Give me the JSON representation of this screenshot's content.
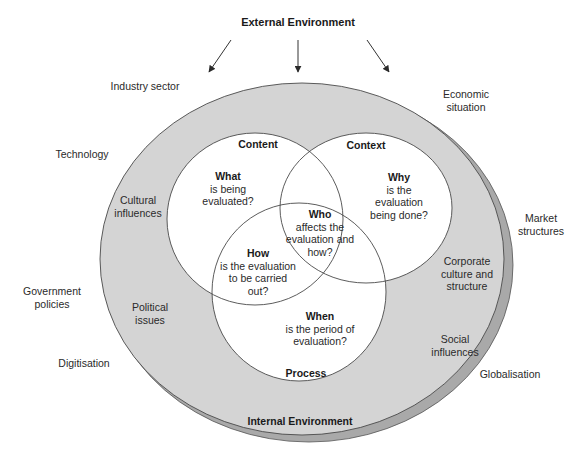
{
  "title": "External Environment",
  "internal_label": "Internal Environment",
  "external_factors": [
    {
      "id": "industry",
      "lines": [
        "Industry sector"
      ],
      "x": 145,
      "y": 90
    },
    {
      "id": "economic",
      "lines": [
        "Economic",
        "situation"
      ],
      "x": 466,
      "y": 98
    },
    {
      "id": "technology",
      "lines": [
        "Technology"
      ],
      "x": 82,
      "y": 158
    },
    {
      "id": "market",
      "lines": [
        "Market",
        "structures"
      ],
      "x": 541,
      "y": 222
    },
    {
      "id": "government",
      "lines": [
        "Government",
        "policies"
      ],
      "x": 52,
      "y": 295
    },
    {
      "id": "digitisation",
      "lines": [
        "Digitisation"
      ],
      "x": 84,
      "y": 367
    },
    {
      "id": "globalisation",
      "lines": [
        "Globalisation"
      ],
      "x": 510,
      "y": 378
    }
  ],
  "internal_factors": [
    {
      "id": "cultural",
      "lines": [
        "Cultural",
        "influences"
      ],
      "x": 138,
      "y": 204
    },
    {
      "id": "corporate",
      "lines": [
        "Corporate",
        "culture and",
        "structure"
      ],
      "x": 467,
      "y": 265
    },
    {
      "id": "political",
      "lines": [
        "Political",
        "issues"
      ],
      "x": 150,
      "y": 311
    },
    {
      "id": "social",
      "lines": [
        "Social",
        "influences"
      ],
      "x": 455,
      "y": 343
    }
  ],
  "circles": [
    {
      "id": "content",
      "label": "Content",
      "label_x": 258,
      "label_y": 148
    },
    {
      "id": "context",
      "label": "Context",
      "label_x": 366,
      "label_y": 149
    },
    {
      "id": "process",
      "label": "Process",
      "label_x": 306,
      "label_y": 377
    }
  ],
  "questions": [
    {
      "id": "what",
      "head": "What",
      "lines": [
        "is being",
        "evaluated?"
      ],
      "x": 228,
      "y": 180
    },
    {
      "id": "why",
      "head": "Why",
      "lines": [
        "is the",
        "evaluation",
        "being done?"
      ],
      "x": 399,
      "y": 181
    },
    {
      "id": "who",
      "head": "Who",
      "lines": [
        "affects the",
        "evaluation and",
        "how?"
      ],
      "x": 320,
      "y": 218
    },
    {
      "id": "how",
      "head": "How",
      "lines": [
        "is the evaluation",
        "to be carried",
        "out?"
      ],
      "x": 258,
      "y": 257
    },
    {
      "id": "when",
      "head": "When",
      "lines": [
        "is the period of",
        "evaluation?"
      ],
      "x": 320,
      "y": 320
    }
  ],
  "colors": {
    "ring_fill": "#d4d4d4",
    "shadow_fill": "#a9a9a9",
    "stroke": "#4a4a4a",
    "inner_fill": "#ffffff"
  }
}
